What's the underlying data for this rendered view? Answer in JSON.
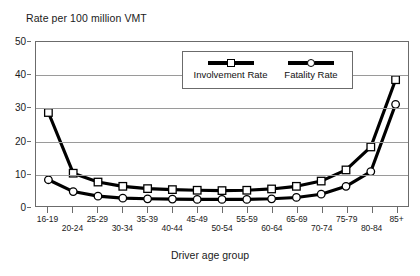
{
  "chart_data": {
    "type": "line",
    "title": "Rate per 100 million VMT",
    "xlabel": "Driver age group",
    "ylabel": "",
    "ylim": [
      0,
      50
    ],
    "yticks": [
      0,
      10,
      20,
      30,
      40,
      50
    ],
    "grid": true,
    "legend_position": "top-center",
    "categories": [
      "16-19",
      "20-24",
      "25-29",
      "30-34",
      "35-39",
      "40-44",
      "45-49",
      "50-54",
      "55-59",
      "60-64",
      "65-69",
      "70-74",
      "75-79",
      "80-84",
      "85+"
    ],
    "series": [
      {
        "name": "Involvement Rate",
        "marker": "square",
        "values": [
          28.5,
          10.0,
          7.3,
          6.0,
          5.3,
          5.0,
          4.8,
          4.7,
          4.8,
          5.2,
          6.0,
          7.6,
          11.0,
          18.0,
          38.5
        ]
      },
      {
        "name": "Fatality Rate",
        "marker": "circle",
        "values": [
          8.0,
          4.4,
          3.0,
          2.4,
          2.2,
          2.1,
          2.0,
          2.0,
          2.0,
          2.2,
          2.6,
          3.6,
          6.0,
          10.5,
          31.0
        ]
      }
    ]
  },
  "axis": {
    "y_tick_labels": [
      "0",
      "10",
      "20",
      "30",
      "40",
      "50"
    ]
  },
  "colors": {
    "line": "#000000",
    "marker_fill": "#ffffff",
    "grid": "#9a9a9a",
    "axis": "#6b6b6b",
    "text": "#1a1a1a",
    "background": "#ffffff"
  }
}
